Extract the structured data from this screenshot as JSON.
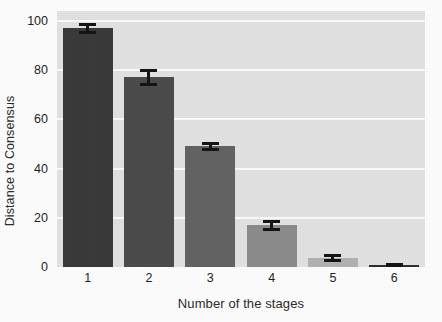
{
  "chart_data": {
    "type": "bar",
    "title": "",
    "xlabel": "Number of the stages",
    "ylabel": "Distance to Consensus",
    "categories": [
      "1",
      "2",
      "3",
      "4",
      "5",
      "6"
    ],
    "values": [
      97,
      77,
      49,
      17,
      3.5,
      1
    ],
    "errors": [
      2.2,
      3.5,
      1.8,
      2.2,
      1.6,
      0.8
    ],
    "xtick_labels": [
      "1",
      "2",
      "3",
      "4",
      "5",
      "6"
    ],
    "ytick_labels": [
      "0",
      "20",
      "40",
      "60",
      "80",
      "100"
    ],
    "ytick_values": [
      0,
      20,
      40,
      60,
      80,
      100
    ],
    "ylim": [
      0,
      104
    ],
    "grid": "horizontal-white",
    "legend": "none",
    "bar_colors": [
      "#3a3a3a",
      "#4c4c4c",
      "#636363",
      "#8b8b8b",
      "#b2b2b2",
      "#2f2f2f"
    ],
    "plot_background": "#e2e2e2",
    "gridline_color": "#fbfbfb",
    "error_bar_color": "#151515"
  }
}
